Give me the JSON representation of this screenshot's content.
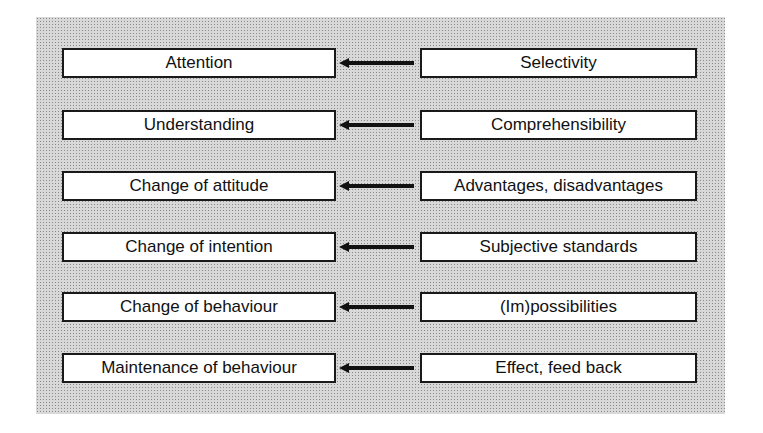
{
  "diagram": {
    "rows": [
      {
        "left": "Attention",
        "right": "Selectivity"
      },
      {
        "left": "Understanding",
        "right": "Comprehensibility"
      },
      {
        "left": "Change of attitude",
        "right": "Advantages, disadvantages"
      },
      {
        "left": "Change of intention",
        "right": "Subjective standards"
      },
      {
        "left": "Change of behaviour",
        "right": "(Im)possibilities"
      },
      {
        "left": "Maintenance of behaviour",
        "right": "Effect, feed back"
      }
    ],
    "arrow_direction": "right-to-left"
  }
}
